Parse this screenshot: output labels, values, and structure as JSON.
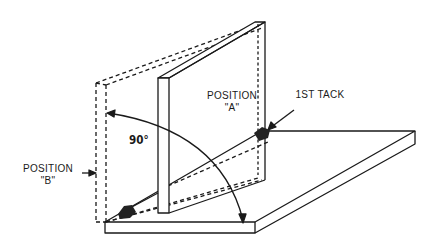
{
  "diagram": {
    "type": "technical-illustration",
    "labels": {
      "position_a_line1": "POSITION",
      "position_a_line2": "\"A\"",
      "position_b_line1": "POSITION",
      "position_b_line2": "\"B\"",
      "first_tack": "1ST TACK",
      "angle": "90°"
    },
    "colors": {
      "line": "#1a1a1a",
      "background": "#ffffff",
      "tack": "#222222"
    }
  }
}
